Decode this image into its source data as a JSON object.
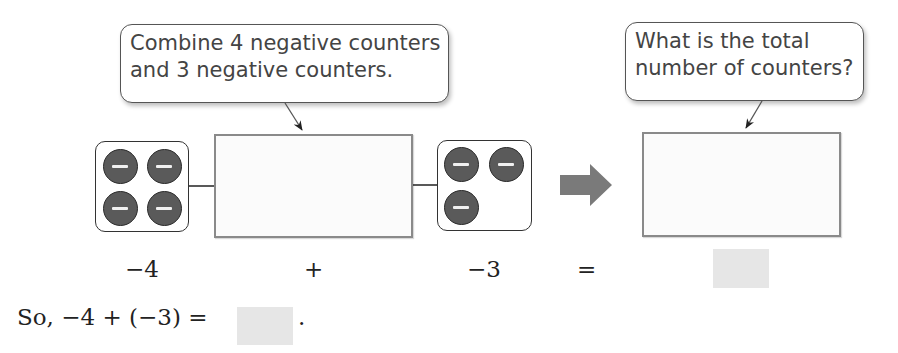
{
  "callouts": {
    "left": {
      "line1": "Combine 4 negative counters",
      "line2": "and 3 negative counters."
    },
    "right": {
      "line1": "What is the total",
      "line2": "number of counters?"
    }
  },
  "counters": {
    "left_count": 4,
    "right_count": 3,
    "sign": "negative",
    "symbol": "−",
    "color": "#5a5a5a"
  },
  "equation_row": {
    "term1": "−4",
    "op1": "+",
    "term2": "−3",
    "op2": "=",
    "answer": ""
  },
  "conclusion": {
    "prefix": "So, −4 + (−3) =",
    "answer": "",
    "suffix": "."
  },
  "colors": {
    "answer_box": "#e6e6e6",
    "big_arrow": "#7a7a7a",
    "counter_fill": "#5a5a5a"
  }
}
